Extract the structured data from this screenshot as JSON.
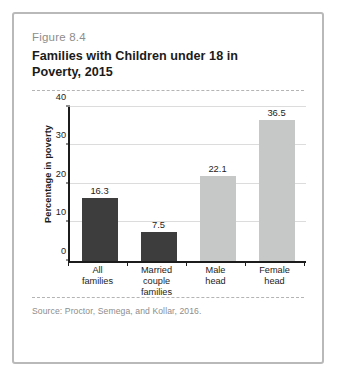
{
  "figure": {
    "number": "Figure 8.4",
    "title": "Families with Children under 18 in Poverty, 2015",
    "source": "Source: Proctor, Semega, and Kollar, 2016."
  },
  "colors": {
    "bar_dark": "#3d3d3d",
    "bar_light": "#c6c7c7",
    "axis": "#1c1c1c",
    "gridline": "#dcdcdc",
    "border": "#b9b9b9",
    "muted_text": "#8d8d8d"
  },
  "chart_data": {
    "type": "bar",
    "title": "Families with Children under 18 in Poverty, 2015",
    "xlabel": "",
    "ylabel": "Percentage in poverty",
    "categories": [
      "All families",
      "Married couple families",
      "Male head",
      "Female head"
    ],
    "category_lines": [
      [
        "All",
        "families"
      ],
      [
        "Married",
        "couple",
        "families"
      ],
      [
        "Male",
        "head"
      ],
      [
        "Female",
        "head"
      ]
    ],
    "values": [
      16.3,
      7.5,
      22.1,
      36.5
    ],
    "value_labels": [
      "16.3",
      "7.5",
      "22.1",
      "36.5"
    ],
    "bar_colors": [
      "#3d3d3d",
      "#3d3d3d",
      "#c6c7c7",
      "#c6c7c7"
    ],
    "ylim": [
      0,
      40
    ],
    "yticks": [
      0,
      10,
      20,
      30,
      40
    ],
    "ytick_labels": [
      "0",
      "10",
      "20",
      "30",
      "40"
    ],
    "grid": true,
    "legend": false
  }
}
